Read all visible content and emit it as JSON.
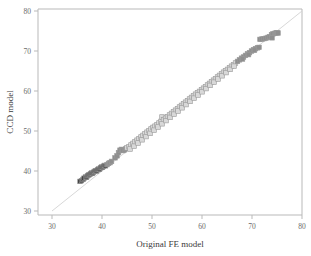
{
  "chart_data": {
    "type": "scatter",
    "title": "",
    "xlabel": "Original FE model",
    "ylabel": "CCD model",
    "xlim": [
      26,
      82
    ],
    "ylim": [
      27,
      82
    ],
    "xticks": [
      30,
      40,
      50,
      60,
      70,
      80
    ],
    "yticks": [
      30,
      40,
      50,
      60,
      70,
      80
    ],
    "grid": false,
    "legend": null,
    "annotations": [
      "identity reference line y = x drawn from (30,30) to (80,80)"
    ],
    "reference_line": {
      "x0": 30,
      "y0": 30,
      "x1": 80,
      "y1": 80,
      "color": "#d2d2d2"
    },
    "marker": {
      "shape": "square",
      "size": 4.6,
      "rotation_deg": 0
    },
    "colors": {
      "dark": "#3c3c3c",
      "mid": "#8e8e8e",
      "light": "#d8d8d8"
    },
    "series": [
      {
        "name": "low range",
        "color": "#3c3c3c",
        "points": [
          [
            35.6,
            37.4
          ],
          [
            35.9,
            37.6
          ],
          [
            36.2,
            37.9
          ],
          [
            36.4,
            38.2
          ],
          [
            36.7,
            38.5
          ],
          [
            36.9,
            38.4
          ],
          [
            37.1,
            38.8
          ],
          [
            37.3,
            39.0
          ],
          [
            37.5,
            39.1
          ],
          [
            37.7,
            39.3
          ],
          [
            37.9,
            39.5
          ],
          [
            38.1,
            39.4
          ],
          [
            38.3,
            39.7
          ],
          [
            38.5,
            39.9
          ],
          [
            38.7,
            40.1
          ],
          [
            38.9,
            40.0
          ],
          [
            39.1,
            40.3
          ],
          [
            39.3,
            40.5
          ],
          [
            39.5,
            40.4
          ],
          [
            39.7,
            40.8
          ],
          [
            39.9,
            41.0
          ],
          [
            40.1,
            40.9
          ],
          [
            40.3,
            41.2
          ],
          [
            40.5,
            41.4
          ],
          [
            40.7,
            41.3
          ]
        ]
      },
      {
        "name": "mid-low range",
        "color": "#8e8e8e",
        "points": [
          [
            41.0,
            41.6
          ],
          [
            41.3,
            41.9
          ],
          [
            41.6,
            42.1
          ],
          [
            41.9,
            42.4
          ],
          [
            42.6,
            43.3
          ],
          [
            43.0,
            43.8
          ],
          [
            43.3,
            44.6
          ],
          [
            43.6,
            45.2
          ],
          [
            43.9,
            45.4
          ],
          [
            44.2,
            45.1
          ],
          [
            44.5,
            45.3
          ],
          [
            44.8,
            45.6
          ]
        ]
      },
      {
        "name": "central range",
        "color": "#d8d8d8",
        "points": [
          [
            45.0,
            45.8
          ],
          [
            45.4,
            46.1
          ],
          [
            45.8,
            46.5
          ],
          [
            46.2,
            46.9
          ],
          [
            46.6,
            47.3
          ],
          [
            47.0,
            47.7
          ],
          [
            47.4,
            48.1
          ],
          [
            47.8,
            48.5
          ],
          [
            48.2,
            48.9
          ],
          [
            48.6,
            49.3
          ],
          [
            49.0,
            49.7
          ],
          [
            49.4,
            50.1
          ],
          [
            49.8,
            50.5
          ],
          [
            50.2,
            50.9
          ],
          [
            50.6,
            51.2
          ],
          [
            51.0,
            51.6
          ],
          [
            51.4,
            52.0
          ],
          [
            51.8,
            52.4
          ],
          [
            52.0,
            53.5
          ],
          [
            52.3,
            52.8
          ],
          [
            52.7,
            53.2
          ],
          [
            53.1,
            53.6
          ],
          [
            53.5,
            54.0
          ],
          [
            53.9,
            54.4
          ],
          [
            54.3,
            54.8
          ],
          [
            54.7,
            55.2
          ],
          [
            55.1,
            55.6
          ],
          [
            55.5,
            56.0
          ],
          [
            55.9,
            56.4
          ],
          [
            56.3,
            56.8
          ],
          [
            56.7,
            57.2
          ],
          [
            57.1,
            57.6
          ],
          [
            57.5,
            58.0
          ],
          [
            57.9,
            58.4
          ],
          [
            58.3,
            58.8
          ],
          [
            58.7,
            59.2
          ],
          [
            59.1,
            59.6
          ],
          [
            59.5,
            59.9
          ],
          [
            59.9,
            60.3
          ],
          [
            60.3,
            60.7
          ],
          [
            60.7,
            61.1
          ],
          [
            61.1,
            61.5
          ],
          [
            61.5,
            61.9
          ],
          [
            61.9,
            62.3
          ],
          [
            62.3,
            62.7
          ],
          [
            62.7,
            63.1
          ],
          [
            63.1,
            63.5
          ],
          [
            63.5,
            63.9
          ],
          [
            63.9,
            64.3
          ],
          [
            64.3,
            64.7
          ],
          [
            64.7,
            65.1
          ],
          [
            65.1,
            65.4
          ],
          [
            65.5,
            65.8
          ],
          [
            65.9,
            66.2
          ],
          [
            66.3,
            66.6
          ],
          [
            66.7,
            67.0
          ],
          [
            45.6,
            45.5
          ],
          [
            46.4,
            46.2
          ],
          [
            47.2,
            47.0
          ],
          [
            48.0,
            47.8
          ],
          [
            48.8,
            48.6
          ],
          [
            49.6,
            49.4
          ],
          [
            50.4,
            50.2
          ],
          [
            51.2,
            51.0
          ],
          [
            52.0,
            51.8
          ],
          [
            52.8,
            52.6
          ],
          [
            53.6,
            53.4
          ],
          [
            54.4,
            54.2
          ],
          [
            55.2,
            55.0
          ],
          [
            56.0,
            55.8
          ],
          [
            56.8,
            56.6
          ],
          [
            57.6,
            57.4
          ],
          [
            58.4,
            58.2
          ],
          [
            59.2,
            59.0
          ],
          [
            60.0,
            59.8
          ],
          [
            60.8,
            60.6
          ],
          [
            61.6,
            61.4
          ],
          [
            62.4,
            62.2
          ],
          [
            63.2,
            63.0
          ],
          [
            64.0,
            63.8
          ],
          [
            64.8,
            64.6
          ],
          [
            65.6,
            65.4
          ],
          [
            66.4,
            66.2
          ]
        ]
      },
      {
        "name": "high range",
        "color": "#8e8e8e",
        "points": [
          [
            67.1,
            67.4
          ],
          [
            67.5,
            67.8
          ],
          [
            67.9,
            68.2
          ],
          [
            68.3,
            68.5
          ],
          [
            68.7,
            68.9
          ],
          [
            69.1,
            69.3
          ],
          [
            69.5,
            69.6
          ],
          [
            69.9,
            70.0
          ],
          [
            70.3,
            70.3
          ],
          [
            70.7,
            70.6
          ],
          [
            71.1,
            70.8
          ],
          [
            71.4,
            70.9
          ],
          [
            71.6,
            72.9
          ],
          [
            72.0,
            73.0
          ],
          [
            72.4,
            73.1
          ],
          [
            72.8,
            73.2
          ],
          [
            73.2,
            73.4
          ],
          [
            73.5,
            73.6
          ],
          [
            73.9,
            74.1
          ],
          [
            74.2,
            74.3
          ],
          [
            74.5,
            74.4
          ],
          [
            74.8,
            74.5
          ],
          [
            75.0,
            74.6
          ],
          [
            75.2,
            74.5
          ],
          [
            74.0,
            73.3
          ],
          [
            70.5,
            70.2
          ],
          [
            69.3,
            69.1
          ],
          [
            68.1,
            68.0
          ]
        ]
      }
    ]
  },
  "axes": {
    "x_tick_labels": [
      "30",
      "40",
      "50",
      "60",
      "70",
      "80"
    ],
    "y_tick_labels": [
      "30",
      "40",
      "50",
      "60",
      "70",
      "80"
    ],
    "x_title": "Original FE model",
    "y_title": "CCD model"
  }
}
